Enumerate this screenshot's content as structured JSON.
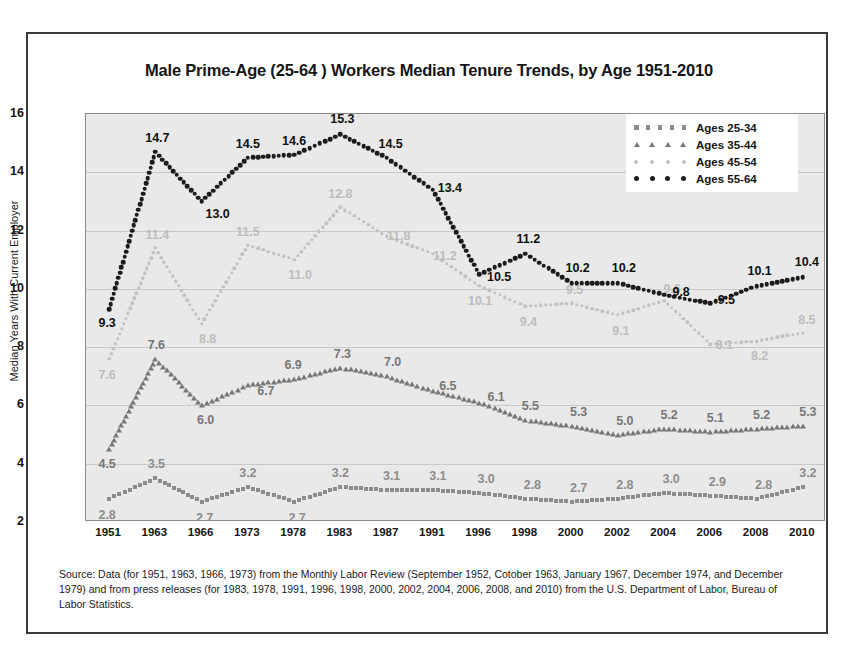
{
  "figure": {
    "title": "Male Prime-Age (25-64 ) Workers Median Tenure Trends, by Age 1951-2010",
    "source": "Source: Data (for 1951, 1963, 1966, 1973) from the Monthly Labor Review (September 1952, Cotober 1963, January 1967, December 1974, and December 1979) and from press releases (for 1983, 1978, 1991, 1996, 1998, 2000, 2002, 2004, 2006, 2008, and 2010) from the U.S. Department of Labor, Bureau of Labor Statistics."
  },
  "chart_data": {
    "type": "line",
    "title": "Male Prime-Age (25-64 ) Workers Median Tenure Trends, by Age 1951-2010",
    "xlabel": "",
    "ylabel": "Median Years With Current Employer",
    "categories": [
      "1951",
      "1963",
      "1966",
      "1973",
      "1978",
      "1983",
      "1987",
      "1991",
      "1996",
      "1998",
      "2000",
      "2002",
      "2004",
      "2006",
      "2008",
      "2010"
    ],
    "ylim": [
      2,
      16
    ],
    "yticks": [
      2,
      4,
      6,
      8,
      10,
      12,
      14,
      16
    ],
    "grid": true,
    "legend_position": "top-right",
    "series": [
      {
        "name": "Ages 25-34",
        "marker": "square",
        "color": "#8d8d8d",
        "label_color": "#8d8d8d",
        "values": [
          2.8,
          3.5,
          2.7,
          3.2,
          2.7,
          3.2,
          3.1,
          3.1,
          3.0,
          2.8,
          2.7,
          2.8,
          3.0,
          2.9,
          2.8,
          3.2
        ]
      },
      {
        "name": "Ages 35-44",
        "marker": "triangle",
        "color": "#777777",
        "label_color": "#777777",
        "values": [
          4.5,
          7.6,
          6.0,
          6.7,
          6.9,
          7.3,
          7.0,
          6.5,
          6.1,
          5.5,
          5.3,
          5.0,
          5.2,
          5.1,
          5.2,
          5.3
        ]
      },
      {
        "name": "Ages 45-54",
        "marker": "star",
        "color": "#c2c2c2",
        "label_color": "#bdbdbd",
        "values": [
          7.6,
          11.4,
          8.8,
          11.5,
          11.0,
          12.8,
          11.8,
          11.2,
          10.1,
          9.4,
          9.5,
          9.1,
          9.6,
          8.1,
          8.2,
          8.5
        ]
      },
      {
        "name": "Ages 55-64",
        "marker": "circle",
        "color": "#1c1c1c",
        "label_color": "#101010",
        "values": [
          9.3,
          14.7,
          13.0,
          14.5,
          14.6,
          15.3,
          14.5,
          13.4,
          10.5,
          11.2,
          10.2,
          10.2,
          9.8,
          9.5,
          10.1,
          10.4
        ]
      }
    ],
    "data_labels": {
      "Ages 25-34": [
        "2.8",
        "3.5",
        "2.7",
        "3.2",
        "2.7",
        "3.2",
        "3.1",
        "3.1",
        "3.0",
        "2.8",
        "2.7",
        "2.8",
        "3.0",
        "2.9",
        "2.8",
        "3.2"
      ],
      "Ages 35-44": [
        "4.5",
        "7.6",
        "6.0",
        "6.7",
        "6.9",
        "7.3",
        "7.0",
        "6.5",
        "6.1",
        "5.5",
        "5.3",
        "5.0",
        "5.2",
        "5.1",
        "5.2",
        "5.3"
      ],
      "Ages 45-54": [
        "7.6",
        "11.4",
        "8.8",
        "11.5",
        "11.0",
        "12.8",
        "11.8",
        "11.2",
        "10.1",
        "9.4",
        "9.5",
        "9.1",
        "9.6",
        "8.1",
        "8.2",
        "8.5"
      ],
      "Ages 55-64": [
        "9.3",
        "14.7",
        "13.0",
        "14.5",
        "14.6",
        "15.3",
        "14.5",
        "13.4",
        "10.5",
        "11.2",
        "10.2",
        "10.2",
        "9.8",
        "9.5",
        "10.1",
        "10.4"
      ]
    }
  },
  "colors": {
    "plot_background": "#e9e9e9",
    "gridline": "#c9c9c9",
    "frame": "#3a3a3a"
  }
}
